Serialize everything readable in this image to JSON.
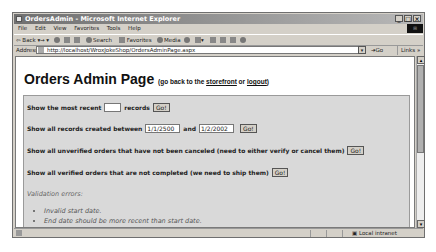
{
  "window": {
    "title": "OrdersAdmin - Microsoft Internet Explorer",
    "controls": [
      "_",
      "□",
      "×"
    ]
  },
  "menubar": {
    "items": [
      "File",
      "Edit",
      "View",
      "Favorites",
      "Tools",
      "Help"
    ]
  },
  "toolbar": {
    "back_label": "Back",
    "forward_label": "→",
    "search_label": "Search",
    "favorites_label": "Favorites",
    "media_label": "Media"
  },
  "addressbar": {
    "label": "Address",
    "url": "http://localhost/WroxJokeShop/OrdersAdminPage.aspx",
    "go_label": "Go",
    "links_label": "Links »"
  },
  "page": {
    "title": "Orders Admin Page",
    "subtitle_prefix": "(go back to the ",
    "storefront_link": "storefront",
    "subtitle_or": " or ",
    "logout_link": "logout",
    "subtitle_suffix": ")"
  },
  "panel": {
    "row1": {
      "prefix": "Show the most recent",
      "value": "",
      "suffix": "records",
      "button": "Go!"
    },
    "row2": {
      "prefix": "Show all records created between",
      "start_date": "1/1/2500",
      "and_label": "and",
      "end_date": "1/2/2002",
      "button": "Go!"
    },
    "row3": {
      "label": "Show all unverified orders that have not been canceled (need to either verify or cancel them)",
      "button": "Go!"
    },
    "row4": {
      "label": "Show all verified orders that are not completed (we need to ship them)",
      "button": "Go!"
    },
    "validation": {
      "heading": "Validation errors:",
      "errors": [
        "Invalid start date.",
        "End date should be more recent than start date."
      ]
    }
  },
  "statusbar": {
    "zone": "Local intranet"
  }
}
